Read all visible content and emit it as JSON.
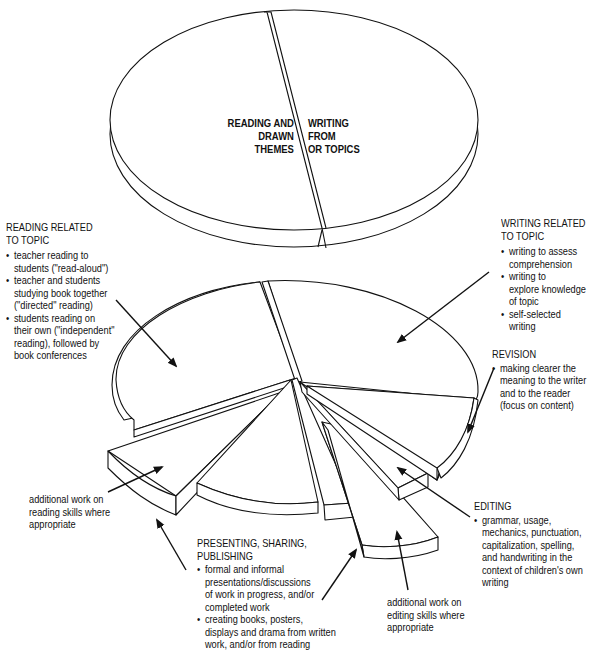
{
  "top_pie": {
    "left_slice": "READING AND\n      DRAWN\n  THEMES",
    "right_slice": "WRITING\n  FROM\n  OR TOPICS"
  },
  "reading_related": {
    "heading": "READING RELATED\nTO TOPIC",
    "bullets": [
      "teacher reading to\nstudents (\"read-aloud\")",
      "teacher and students\nstudying book together\n(\"directed\" reading)",
      "students reading on\ntheir own (\"independent\"\nreading), followed by\nbook conferences"
    ]
  },
  "writing_related": {
    "heading": "WRITING RELATED\nTO TOPIC",
    "bullets": [
      "writing to assess\ncomprehension",
      "writing to\nexplore knowledge\nof topic",
      "self-selected\nwriting"
    ]
  },
  "revision": {
    "heading": "REVISION",
    "bullets": [
      "making clearer the\nmeaning to the writer\nand to the reader\n(focus on content)"
    ]
  },
  "editing": {
    "heading": "EDITING",
    "bullets": [
      "grammar, usage,\nmechanics, punctuation,\ncapitalization, spelling,\nand handwriting in the\ncontext of children's own\nwriting"
    ]
  },
  "reading_skills": {
    "text": "additional work on\nreading skills where\nappropriate"
  },
  "editing_skills": {
    "text": "additional work on\nediting skills where\nappropriate"
  },
  "presenting": {
    "heading": "PRESENTING, SHARING,\nPUBLISHING",
    "bullets": [
      "formal and informal\npresentations/discussions\nof work in progress, and/or\ncompleted work",
      "creating books, posters,\ndisplays and drama from written\nwork, and/or from reading"
    ]
  },
  "colors": {
    "line": "#111111",
    "fill": "#ffffff"
  }
}
